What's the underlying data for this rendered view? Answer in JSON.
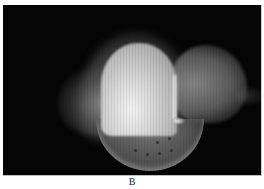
{
  "figure": {
    "panel_label": "B",
    "background_color": "#050505"
  }
}
